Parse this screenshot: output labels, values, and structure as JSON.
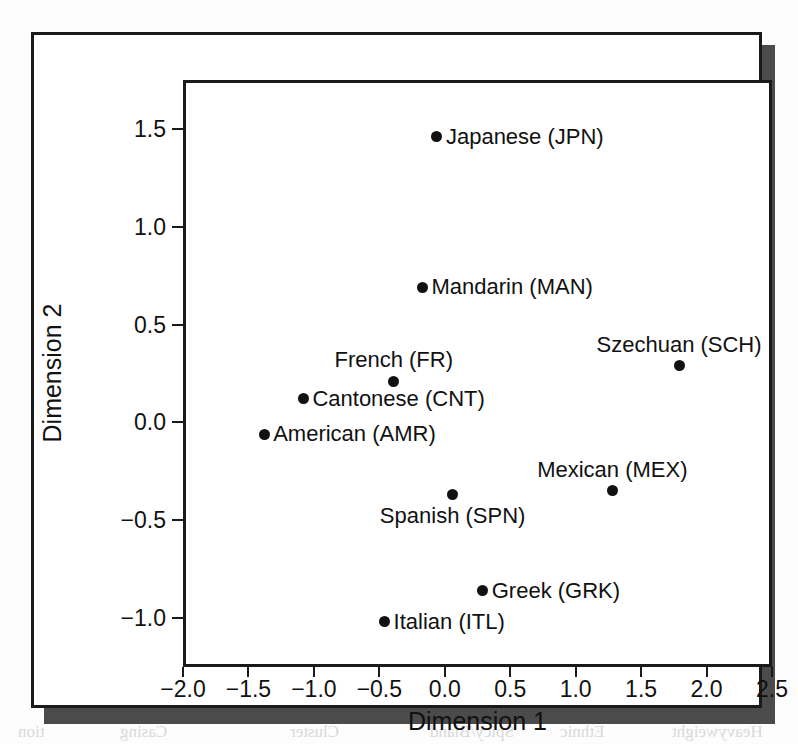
{
  "figure": {
    "caption_fragment_top": "",
    "background_bleed": {
      "bottom_words": [
        "tion",
        "Casing",
        "Cluster",
        "Spicy/Bland",
        "Ethnic",
        "Heavyweight"
      ],
      "mid_words": "Multigrain"
    }
  },
  "chart_data": {
    "type": "scatter",
    "title": "",
    "xlabel": "Dimension 1",
    "ylabel": "Dimension 2",
    "xlim": [
      -2.0,
      2.5
    ],
    "ylim": [
      -1.25,
      1.75
    ],
    "xticks": [
      "-2.0",
      "-1.5",
      "-1.0",
      "-0.5",
      "0.0",
      "0.5",
      "1.0",
      "1.5",
      "2.0",
      "2.5"
    ],
    "xtick_values": [
      -2.0,
      -1.5,
      -1.0,
      -0.5,
      0.0,
      0.5,
      1.0,
      1.5,
      2.0,
      2.5
    ],
    "yticks": [
      "1.5",
      "1.0",
      "0.5",
      "0.0",
      "-0.5",
      "-1.0"
    ],
    "ytick_values": [
      1.5,
      1.0,
      0.5,
      0.0,
      -0.5,
      -1.0
    ],
    "grid": false,
    "legend": "none",
    "marker_color": "#111111",
    "points": [
      {
        "label": "Japanese (JPN)",
        "code": "JPN",
        "x": -0.06,
        "y": 1.46,
        "label_side": "right"
      },
      {
        "label": "Mandarin (MAN)",
        "code": "MAN",
        "x": -0.17,
        "y": 0.69,
        "label_side": "right"
      },
      {
        "label": "Szechuan (SCH)",
        "code": "SCH",
        "x": 1.79,
        "y": 0.29,
        "label_side": "above"
      },
      {
        "label": "French (FR)",
        "code": "FR",
        "x": -0.39,
        "y": 0.21,
        "label_side": "above"
      },
      {
        "label": "Cantonese (CNT)",
        "code": "CNT",
        "x": -1.08,
        "y": 0.12,
        "label_side": "right"
      },
      {
        "label": "American (AMR)",
        "code": "AMR",
        "x": -1.38,
        "y": -0.06,
        "label_side": "right"
      },
      {
        "label": "Mexican (MEX)",
        "code": "MEX",
        "x": 1.28,
        "y": -0.35,
        "label_side": "above"
      },
      {
        "label": "Spanish (SPN)",
        "code": "SPN",
        "x": 0.06,
        "y": -0.37,
        "label_side": "below"
      },
      {
        "label": "Greek (GRK)",
        "code": "GRK",
        "x": 0.29,
        "y": -0.86,
        "label_side": "right"
      },
      {
        "label": "Italian (ITL)",
        "code": "ITL",
        "x": -0.46,
        "y": -1.02,
        "label_side": "right"
      }
    ]
  }
}
